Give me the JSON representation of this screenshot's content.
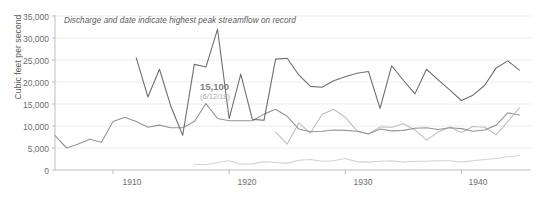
{
  "chart_data": {
    "type": "line",
    "title": "",
    "note": "Discharge and date indicate highest peak streamflow on record",
    "xlabel": "",
    "ylabel": "Cubic feet per second",
    "xlim": [
      1905,
      1946
    ],
    "ylim": [
      0,
      35000
    ],
    "grid": true,
    "legend_position": "none",
    "ytick_labels": [
      "35,000",
      "30,000",
      "25,000",
      "20,000",
      "15,000",
      "10,000",
      "5,000",
      "0"
    ],
    "ytick_values": [
      35000,
      30000,
      25000,
      20000,
      15000,
      10000,
      5000,
      0
    ],
    "xtick_labels": [
      "1910",
      "1920",
      "1930",
      "1940"
    ],
    "xtick_values": [
      1910,
      1920,
      1930,
      1940
    ],
    "annotations": [
      {
        "value_label": "15,100",
        "date_label": "(6/12/18)",
        "x": 1918,
        "y": 15100
      }
    ],
    "colors": {
      "series_peak": "#6d6e71",
      "series_mid_dark": "#939598",
      "series_mid_light": "#bcbec0",
      "series_low": "#d1d3d4",
      "grid": "#ededee",
      "axis": "#bcbec0",
      "text": "#6d6e71"
    },
    "series": [
      {
        "name": "peak-annual-discharge",
        "color": "#6d6e71",
        "x": [
          1912,
          1913,
          1914,
          1915,
          1916,
          1917,
          1918,
          1919,
          1920,
          1921,
          1922,
          1923,
          1924,
          1925,
          1926,
          1927,
          1928,
          1929,
          1930,
          1931,
          1932,
          1933,
          1934,
          1935,
          1936,
          1937,
          1938,
          1939,
          1940,
          1941,
          1942,
          1943,
          1944,
          1945
        ],
        "values": [
          25500,
          16600,
          22900,
          14300,
          7900,
          24000,
          23400,
          32000,
          11700,
          21800,
          11500,
          11300,
          25200,
          25400,
          21600,
          19000,
          18800,
          20300,
          21200,
          22000,
          22400,
          14000,
          23700,
          20400,
          17300,
          22900,
          20500,
          18200,
          15800,
          17000,
          19200,
          23200,
          24800,
          22700
        ]
      },
      {
        "name": "mean-annual-discharge",
        "color": "#939598",
        "x": [
          1905,
          1906,
          1907,
          1908,
          1909,
          1910,
          1911,
          1912,
          1913,
          1914,
          1915,
          1916,
          1917,
          1918,
          1919,
          1920,
          1921,
          1922,
          1923,
          1924,
          1925,
          1926,
          1927,
          1928,
          1929,
          1930,
          1931,
          1932,
          1933,
          1934,
          1935,
          1936,
          1937,
          1938,
          1939,
          1940,
          1941,
          1942,
          1943,
          1944,
          1945
        ],
        "values": [
          7800,
          5000,
          5900,
          7000,
          6300,
          11000,
          12000,
          11000,
          9700,
          10200,
          9600,
          9600,
          11000,
          15100,
          11700,
          11200,
          11200,
          11200,
          12700,
          13800,
          12200,
          9300,
          8700,
          8800,
          9100,
          9000,
          8800,
          8200,
          9300,
          8900,
          9000,
          9500,
          9600,
          9200,
          9600,
          9400,
          8800,
          9100,
          10200,
          13000,
          12500
        ]
      },
      {
        "name": "secondary-gage-discharge",
        "color": "#bcbec0",
        "x": [
          1924,
          1925,
          1926,
          1927,
          1928,
          1929,
          1930,
          1931,
          1932,
          1933,
          1934,
          1935,
          1936,
          1937,
          1938,
          1939,
          1940,
          1941,
          1942,
          1943,
          1944,
          1945
        ],
        "values": [
          8600,
          5900,
          10700,
          8400,
          12600,
          13800,
          12000,
          8900,
          8200,
          9800,
          9700,
          10500,
          9100,
          6800,
          8600,
          9800,
          8500,
          9900,
          9700,
          8000,
          11000,
          14100
        ]
      },
      {
        "name": "base-flow",
        "color": "#d1d3d4",
        "x": [
          1917,
          1918,
          1919,
          1920,
          1921,
          1922,
          1923,
          1924,
          1925,
          1926,
          1927,
          1928,
          1929,
          1930,
          1931,
          1932,
          1933,
          1934,
          1935,
          1936,
          1937,
          1938,
          1939,
          1940,
          1941,
          1942,
          1943,
          1944,
          1945
        ],
        "values": [
          1300,
          1200,
          1700,
          2100,
          1300,
          1400,
          1900,
          1700,
          1500,
          2200,
          2400,
          2000,
          2100,
          2600,
          1900,
          1800,
          2000,
          2100,
          1800,
          2000,
          2000,
          2100,
          2100,
          1800,
          2100,
          2400,
          2600,
          3000,
          3300
        ]
      }
    ]
  }
}
